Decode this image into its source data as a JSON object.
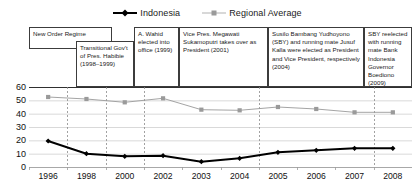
{
  "legend": {
    "position": "top-center",
    "entries": [
      {
        "label": "Indonesia",
        "color": "#000000",
        "marker": "diamond-marker"
      },
      {
        "label": "Regional Average",
        "color": "#9a9a9a",
        "marker": "square-marker"
      }
    ]
  },
  "annotations": [
    {
      "id": "new-order-regime",
      "text": "New Order Regime",
      "x": 0,
      "y": 0,
      "w": 83,
      "h": 22
    },
    {
      "id": "transitional-govt-habibie",
      "text": "Transitional Gov't of Pres. Habibie (1998–1999)",
      "x": 47,
      "y": 14,
      "w": 58,
      "h": 46
    },
    {
      "id": "wahid-elected",
      "text": "A. Wahid elected into office (1999)",
      "x": 105,
      "y": 0,
      "w": 45,
      "h": 60
    },
    {
      "id": "megawati-president",
      "text": "Vice Pres. Megawati Sukamoputri takes over as President (2001)",
      "x": 150,
      "y": 0,
      "w": 89,
      "h": 60
    },
    {
      "id": "sby-elected",
      "text": "Susilo Bambang Yudhoyono (SBY) and running mate Jusuf Kalla were elected as President and Vice President, respectively (2004)",
      "x": 239,
      "y": 0,
      "w": 96,
      "h": 60
    },
    {
      "id": "sby-reelected",
      "text": "SBY reelected with running mate Bank Indonesia Governor Boediono (2009)",
      "x": 335,
      "y": 0,
      "w": 48,
      "h": 60
    }
  ],
  "chart_data": {
    "type": "line",
    "title": "",
    "subtitle": "",
    "xlabel": "",
    "ylabel": "",
    "categories": [
      "1996",
      "1998",
      "2000",
      "2002",
      "2003",
      "2004",
      "2005",
      "2006",
      "2007",
      "2008"
    ],
    "ylim": [
      0,
      60
    ],
    "yticks": [
      0,
      10,
      20,
      30,
      40,
      50,
      60
    ],
    "grid": true,
    "series": [
      {
        "name": "Indonesia",
        "color": "#000000",
        "marker": "diamond",
        "values": [
          19.5,
          10,
          8,
          8.5,
          4,
          6.5,
          11,
          12.5,
          14,
          14
        ]
      },
      {
        "name": "Regional Average",
        "color": "#9a9a9a",
        "marker": "square",
        "values": [
          52.5,
          51,
          48.5,
          51.5,
          43,
          42.5,
          45,
          43.5,
          41,
          41
        ]
      }
    ],
    "event_lines": [
      "1998",
      "2000",
      "2002",
      "2005",
      "2008"
    ]
  }
}
